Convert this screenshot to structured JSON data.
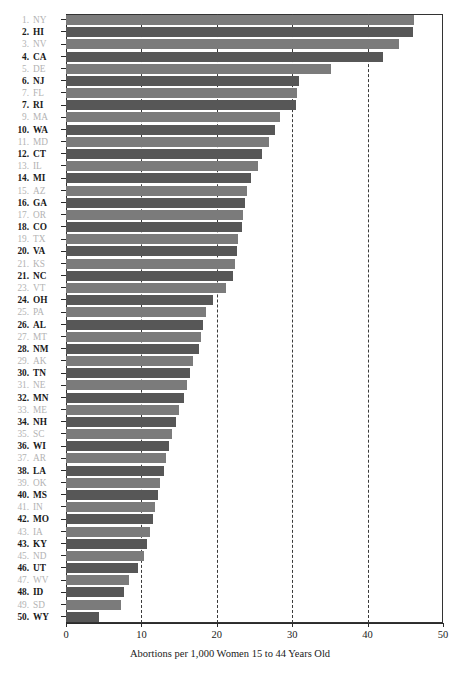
{
  "chart_data": {
    "type": "bar",
    "orientation": "horizontal",
    "title": "",
    "xlabel": "Abortions per 1,000 Women 15 to 44 Years Old",
    "ylabel": "",
    "xlim": [
      0,
      50
    ],
    "xticks": [
      0,
      10,
      20,
      30,
      40,
      50
    ],
    "gridlines": [
      10,
      20,
      30,
      40
    ],
    "grid": "vertical-dashed",
    "legend": "none",
    "categories": [
      "NY",
      "HI",
      "NV",
      "CA",
      "DE",
      "NJ",
      "FL",
      "RI",
      "MA",
      "WA",
      "MD",
      "CT",
      "IL",
      "MI",
      "AZ",
      "GA",
      "OR",
      "CO",
      "TX",
      "VA",
      "KS",
      "NC",
      "VT",
      "OH",
      "PA",
      "AL",
      "MT",
      "NM",
      "AK",
      "TN",
      "NE",
      "MN",
      "ME",
      "NH",
      "SC",
      "WI",
      "AR",
      "LA",
      "OK",
      "MS",
      "IN",
      "MO",
      "IA",
      "KY",
      "ND",
      "UT",
      "WV",
      "ID",
      "SD",
      "WY"
    ],
    "ranks": [
      "1.",
      "2.",
      "3.",
      "4.",
      "5.",
      "6.",
      "7.",
      "7.",
      "9.",
      "10.",
      "11.",
      "12.",
      "13.",
      "14.",
      "15.",
      "16.",
      "17.",
      "18.",
      "19.",
      "20.",
      "21.",
      "21.",
      "23.",
      "24.",
      "25.",
      "26.",
      "27.",
      "28.",
      "29.",
      "30.",
      "31.",
      "32.",
      "33.",
      "34.",
      "35.",
      "36.",
      "37.",
      "38.",
      "39.",
      "40.",
      "41.",
      "42.",
      "43.",
      "43.",
      "45.",
      "46.",
      "47.",
      "48.",
      "49.",
      "50."
    ],
    "values": [
      46.2,
      46.0,
      44.2,
      42.1,
      35.2,
      30.9,
      30.7,
      30.5,
      28.4,
      27.7,
      26.9,
      26.0,
      25.4,
      24.6,
      24.0,
      23.8,
      23.5,
      23.4,
      22.8,
      22.7,
      22.4,
      22.1,
      21.2,
      19.5,
      18.6,
      18.2,
      17.9,
      17.6,
      16.9,
      16.5,
      16.0,
      15.6,
      15.0,
      14.6,
      14.1,
      13.6,
      13.2,
      13.0,
      12.5,
      12.2,
      11.8,
      11.5,
      11.1,
      10.8,
      10.4,
      9.6,
      8.4,
      7.7,
      7.3,
      4.4
    ],
    "series_name": "Abortion rate by state",
    "colors": {
      "bar_even": "#575757",
      "bar_odd": "#7b7b7b",
      "label_even": "#1a1a1a",
      "label_odd": "#b3b3b3",
      "axis": "#2b2b2b",
      "grid": "#3a3a3a",
      "background": "#ffffff"
    }
  }
}
